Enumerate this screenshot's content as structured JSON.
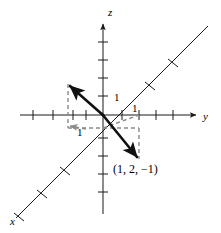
{
  "figure": {
    "width": 221,
    "height": 233,
    "background_color": "#ffffff"
  },
  "colors": {
    "axis": "#1a1a1a",
    "vector": "#111111",
    "dashed": "#8a8a8a",
    "text": "#000000"
  },
  "axes": {
    "z": {
      "label": "z",
      "label_x": 111,
      "label_y": 14,
      "x": 103,
      "y_top": 22,
      "y_bottom": 214,
      "arrow": "up",
      "tick_half_len": 5,
      "tick_positions_y": [
        40,
        58,
        76,
        94,
        136,
        154,
        172,
        190
      ]
    },
    "y": {
      "label": "y",
      "label_x": 205,
      "label_y": 120,
      "y": 115,
      "x_left": 20,
      "x_right": 196,
      "arrow": "right",
      "tick_half_len": 5,
      "tick_positions_x": [
        33,
        53,
        73,
        93,
        113,
        133,
        153,
        173
      ]
    },
    "x": {
      "label": "x",
      "label_x": 10,
      "label_y": 225,
      "x_start": 208,
      "y_start": 26,
      "x_end": 16,
      "y_end": 218,
      "arrow": "none",
      "tick_half_len": 5,
      "tick_fractions": [
        0.18,
        0.3,
        0.62,
        0.74,
        0.86
      ]
    }
  },
  "origin": {
    "x": 103,
    "y": 115
  },
  "tick_labels": [
    {
      "name": "z-one",
      "text": "1",
      "x": 116,
      "y": 98
    },
    {
      "name": "y-one",
      "text": "1",
      "x": 134,
      "y": 113
    },
    {
      "name": "x-one",
      "text": "1",
      "x": 79,
      "y": 133
    }
  ],
  "vectors": [
    {
      "name": "vector-up-left",
      "from_x": 103,
      "from_y": 115,
      "to_x": 68,
      "to_y": 84,
      "arrow": true,
      "width": 2.6
    },
    {
      "name": "vector-down-right",
      "from_x": 103,
      "from_y": 115,
      "to_x": 139,
      "to_y": 159,
      "arrow": true,
      "width": 2.6
    }
  ],
  "dashed_lines": [
    {
      "name": "upper-box-left-edge",
      "x1": 68,
      "y1": 84,
      "x2": 68,
      "y2": 128
    },
    {
      "name": "upper-box-bottom-edge",
      "x1": 68,
      "y1": 128,
      "x2": 103,
      "y2": 128
    },
    {
      "name": "lower-box-top-edge",
      "x1": 103,
      "y1": 128,
      "x2": 139,
      "y2": 128
    },
    {
      "name": "lower-box-right-edge",
      "x1": 139,
      "y1": 128,
      "x2": 139,
      "y2": 159
    },
    {
      "name": "lower-box-arrow-edge",
      "x1": 103,
      "y1": 128,
      "x2": 139,
      "y2": 115
    }
  ],
  "dashed_arrow": {
    "name": "x-unit-arrow",
    "from_x": 84,
    "from_y": 128,
    "to_x": 70,
    "to_y": 126
  },
  "point_label": {
    "name": "coordinate-label",
    "text": "(1, 2, −1)",
    "x": 114,
    "y": 172
  },
  "chart_data": {
    "type": "scatter",
    "title": "",
    "xlabel": "x",
    "ylabel": "y",
    "zlabel": "z",
    "points": [
      {
        "label": "(1, 2, −1)",
        "x": 1,
        "y": 2,
        "z": -1
      }
    ],
    "tick_labels": [
      "1",
      "1",
      "1"
    ],
    "grid": false,
    "legend": "none"
  }
}
